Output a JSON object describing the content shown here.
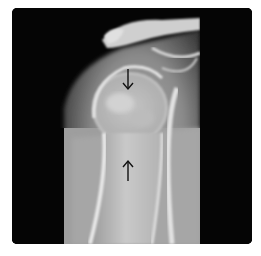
{
  "image": {
    "type": "radiograph",
    "subject": "shoulder / proximal humerus X-ray",
    "top_caption": "",
    "background_color": "#ffffff",
    "frame_color": "#050505"
  },
  "annotations": {
    "arrows": [
      {
        "id": "arrow-top",
        "direction": "down",
        "x": 128,
        "y_start": 69,
        "y_end": 89,
        "color": "#111111"
      },
      {
        "id": "arrow-bottom",
        "direction": "up",
        "x": 128,
        "y_start": 159,
        "y_end": 179,
        "color": "#111111"
      }
    ]
  }
}
